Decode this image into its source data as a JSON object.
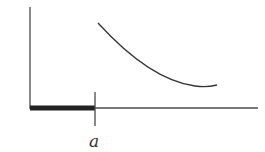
{
  "diagram": {
    "labels": {
      "tick_label": "a"
    },
    "colors": {
      "axis": "#4a4a4a",
      "bar": "#222222",
      "curve": "#333333",
      "background": "#ffffff"
    },
    "elements": {
      "y_axis": {
        "x": 30,
        "y1": 7,
        "y2": 109
      },
      "x_axis": {
        "x1": 30,
        "x2": 258,
        "y": 108
      },
      "thick_segment": {
        "x1": 30,
        "x2": 95,
        "y": 108
      },
      "tick": {
        "x": 95,
        "y1": 92,
        "y2": 126
      },
      "curve": {
        "start": [
          98,
          23
        ],
        "end": [
          217,
          85
        ],
        "shape": "decreasing convex"
      }
    }
  }
}
